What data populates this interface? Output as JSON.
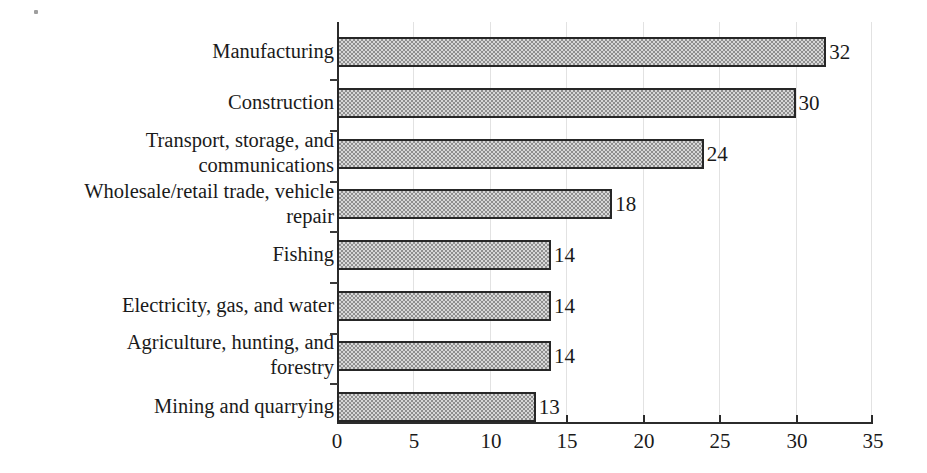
{
  "chart_data": {
    "type": "bar",
    "orientation": "horizontal",
    "title": "",
    "subtitle": "",
    "xlabel": "",
    "ylabel": "",
    "xlim": [
      0,
      35
    ],
    "xticks": [
      0,
      5,
      10,
      15,
      20,
      25,
      30,
      35
    ],
    "xtick_labels": [
      "0",
      "5",
      "10",
      "15",
      "20",
      "25",
      "30",
      "35"
    ],
    "grid": true,
    "grid_axis": "x",
    "legend": false,
    "legend_position": "none",
    "annotations": "Each bar is labeled with its value at the bar end.",
    "categories": [
      "Manufacturing",
      "Construction",
      "Transport, storage, and communications",
      "Wholesale/retail trade, vehicle repair",
      "Fishing",
      "Electricity, gas, and water",
      "Agriculture, hunting, and forestry",
      "Mining and quarrying"
    ],
    "values": [
      32,
      30,
      24,
      18,
      14,
      14,
      14,
      13
    ],
    "value_labels": [
      "32",
      "30",
      "24",
      "18",
      "14",
      "14",
      "14",
      "13"
    ],
    "bars": [
      {
        "label": "Manufacturing",
        "label_lines": [
          "Manufacturing"
        ],
        "value": 32,
        "value_label": "32"
      },
      {
        "label": "Construction",
        "label_lines": [
          "Construction"
        ],
        "value": 30,
        "value_label": "30"
      },
      {
        "label": "Transport, storage, and communications",
        "label_lines": [
          "Transport, storage, and",
          "communications"
        ],
        "value": 24,
        "value_label": "24"
      },
      {
        "label": "Wholesale/retail trade, vehicle repair",
        "label_lines": [
          "Wholesale/retail trade, vehicle",
          "repair"
        ],
        "value": 18,
        "value_label": "18"
      },
      {
        "label": "Fishing",
        "label_lines": [
          "Fishing"
        ],
        "value": 14,
        "value_label": "14"
      },
      {
        "label": "Electricity, gas, and water",
        "label_lines": [
          "Electricity, gas, and water"
        ],
        "value": 14,
        "value_label": "14"
      },
      {
        "label": "Agriculture, hunting, and forestry",
        "label_lines": [
          "Agriculture, hunting, and",
          "forestry"
        ],
        "value": 14,
        "value_label": "14"
      },
      {
        "label": "Mining and quarrying",
        "label_lines": [
          "Mining and quarrying"
        ],
        "value": 13,
        "value_label": "13"
      }
    ],
    "colors": {
      "bar_fill": "#b5b5b5",
      "bar_border": "#262626",
      "axis": "#2b2b2b",
      "gridline": "#e2e2e2",
      "text": "#1a1a1a",
      "background": "#ffffff"
    }
  }
}
